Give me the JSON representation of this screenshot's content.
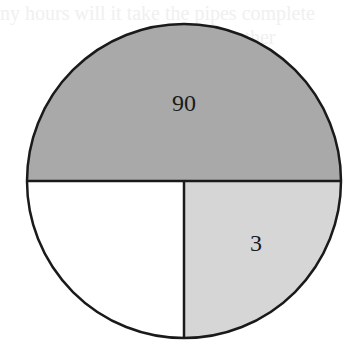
{
  "ghost_text": {
    "line1": "ny hours will it take the pipes complete",
    "line2": "together"
  },
  "diagram": {
    "type": "pie",
    "center": [
      184,
      181
    ],
    "radius": 157,
    "colors": {
      "outline": "#1a1a1a",
      "top_half": "#a9a9a9",
      "bottom_right": "#d6d6d6",
      "bottom_left": "#ffffff"
    },
    "sections": [
      {
        "name": "top-half",
        "label": "90"
      },
      {
        "name": "bottom-right-quarter",
        "label": "3"
      },
      {
        "name": "bottom-left-quarter",
        "label": ""
      }
    ]
  }
}
